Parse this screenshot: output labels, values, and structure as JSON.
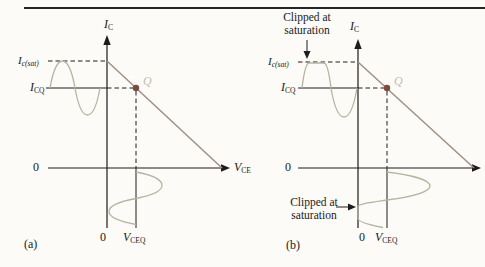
{
  "colors": {
    "bg": "#fcfbf7",
    "rule": "#262626",
    "axis": "#1c1c1c",
    "text": "#1a1a1a",
    "load_line": "#a18f86",
    "q_dot": "#7d4b3e",
    "q_label": "#c6bcab",
    "waveform": "#b4b5a0"
  },
  "fig_a": {
    "caption": "(a)",
    "labels": {
      "ic_main": "I",
      "ic_sub": "C",
      "icsat_main": "I",
      "icsat_sub": "c(sat)",
      "icq_main": "I",
      "icq_sub": "CQ",
      "q": "Q",
      "zero_origin": "0",
      "zero_bottom": "0",
      "vce_main": "V",
      "vce_sub": "CE",
      "vceq_main": "V",
      "vceq_sub": "CEQ"
    }
  },
  "fig_b": {
    "caption": "(b)",
    "labels": {
      "ic_main": "I",
      "ic_sub": "C",
      "icsat_main": "I",
      "icsat_sub": "c(sat)",
      "icq_main": "I",
      "icq_sub": "CQ",
      "q": "Q",
      "zero_origin": "0",
      "zero_bottom": "0",
      "vceq_main": "V",
      "vceq_sub": "CEQ",
      "clipped_top_line1": "Clipped at",
      "clipped_top_line2": "saturation",
      "clipped_bottom_line1": "Clipped at",
      "clipped_bottom_line2": "saturation"
    }
  }
}
